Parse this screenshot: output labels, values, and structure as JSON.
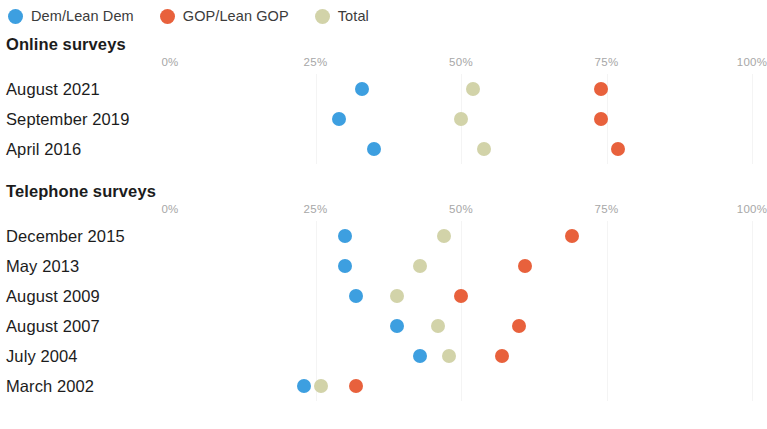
{
  "legend": {
    "items": [
      {
        "label": "Dem/Lean Dem",
        "color": "#3d9fe0",
        "key": "dem"
      },
      {
        "label": "GOP/Lean GOP",
        "color": "#e8613c",
        "key": "gop"
      },
      {
        "label": "Total",
        "color": "#d2d3a9",
        "key": "total"
      }
    ]
  },
  "axis": {
    "ticks": [
      "0%",
      "25%",
      "50%",
      "75%",
      "100%"
    ],
    "tick_values": [
      0,
      25,
      50,
      75,
      100
    ],
    "min": 0,
    "max": 100
  },
  "sections": [
    {
      "id": "online",
      "title": "Online surveys",
      "rows": [
        {
          "label": "August 2021",
          "dem": 33,
          "total": 52,
          "gop": 74
        },
        {
          "label": "September 2019",
          "dem": 29,
          "total": 50,
          "gop": 74
        },
        {
          "label": "April 2016",
          "dem": 35,
          "total": 54,
          "gop": 77
        }
      ]
    },
    {
      "id": "phone",
      "title": "Telephone surveys",
      "rows": [
        {
          "label": "December 2015",
          "dem": 30,
          "total": 47,
          "gop": 69
        },
        {
          "label": "May 2013",
          "dem": 30,
          "total": 43,
          "gop": 61
        },
        {
          "label": "August 2009",
          "dem": 32,
          "total": 39,
          "gop": 50
        },
        {
          "label": "August 2007",
          "dem": 39,
          "total": 46,
          "gop": 60
        },
        {
          "label": "July 2004",
          "dem": 43,
          "total": 48,
          "gop": 57
        },
        {
          "label": "March 2002",
          "dem": 23,
          "total": 26,
          "gop": 32
        }
      ]
    }
  ],
  "chart_data": {
    "type": "scatter",
    "title": "",
    "xlabel": "",
    "ylabel": "",
    "xlim": [
      0,
      100
    ],
    "grid": true,
    "legend_position": "top-left",
    "xticks": [
      0,
      25,
      50,
      75,
      100
    ],
    "xticklabels": [
      "0%",
      "25%",
      "50%",
      "75%",
      "100%"
    ],
    "series": [
      {
        "name": "Dem/Lean Dem",
        "color": "#3d9fe0"
      },
      {
        "name": "GOP/Lean GOP",
        "color": "#e8613c"
      },
      {
        "name": "Total",
        "color": "#d2d3a9"
      }
    ],
    "panels": [
      {
        "title": "Online surveys",
        "categories": [
          "August 2021",
          "September 2019",
          "April 2016"
        ],
        "values": {
          "Dem/Lean Dem": [
            33,
            29,
            35
          ],
          "Total": [
            52,
            50,
            54
          ],
          "GOP/Lean GOP": [
            74,
            74,
            77
          ]
        }
      },
      {
        "title": "Telephone surveys",
        "categories": [
          "December 2015",
          "May 2013",
          "August 2009",
          "August 2007",
          "July 2004",
          "March 2002"
        ],
        "values": {
          "Dem/Lean Dem": [
            30,
            30,
            32,
            39,
            43,
            23
          ],
          "Total": [
            47,
            43,
            39,
            46,
            48,
            26
          ],
          "GOP/Lean GOP": [
            69,
            61,
            50,
            60,
            57,
            32
          ]
        }
      }
    ]
  }
}
